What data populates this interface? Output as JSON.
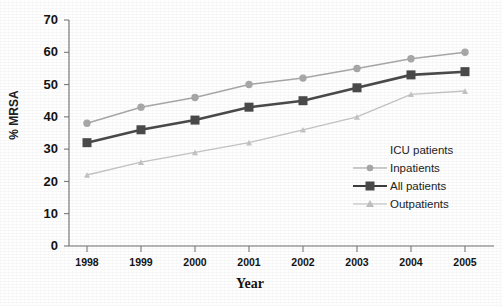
{
  "chart_data": {
    "type": "line",
    "title": "",
    "xlabel": "Year",
    "ylabel": "% MRSA",
    "categories": [
      "1998",
      "1999",
      "2000",
      "2001",
      "2002",
      "2003",
      "2004",
      "2005"
    ],
    "xlim": [
      1998,
      2005
    ],
    "ylim": [
      0,
      70
    ],
    "yticks": [
      "70",
      "60",
      "50",
      "40",
      "30",
      "20",
      "10",
      "0"
    ],
    "ytick_values": [
      70,
      60,
      50,
      40,
      30,
      20,
      10,
      0
    ],
    "grid": false,
    "legend_position": "inside-lower-right",
    "legend_title": "ICU patients",
    "series": [
      {
        "name": "ICU patients",
        "marker": "circle",
        "color": "#a8a8a8",
        "values": [
          38,
          43,
          46,
          50,
          52,
          55,
          58,
          60
        ]
      },
      {
        "name": "Inpatients",
        "marker": "circle",
        "color": "#a8a8a8",
        "values": [
          38,
          43,
          46,
          50,
          52,
          55,
          58,
          60
        ]
      },
      {
        "name": "All patients",
        "marker": "square",
        "color": "#4a4a4a",
        "values": [
          32,
          36,
          39,
          43,
          45,
          49,
          53,
          54
        ]
      },
      {
        "name": "Outpatients",
        "marker": "triangle",
        "color": "#c4c4c4",
        "values": [
          22,
          26,
          29,
          32,
          36,
          40,
          47,
          48
        ]
      }
    ]
  },
  "legend": {
    "rows": [
      {
        "label": "ICU patients",
        "marker": "none"
      },
      {
        "label": "Inpatients",
        "marker": "circle"
      },
      {
        "label": "All patients",
        "marker": "square"
      },
      {
        "label": "Outpatients",
        "marker": "triangle"
      }
    ]
  },
  "colors": {
    "inpatients": "#a8a8a8",
    "all_patients": "#4a4a4a",
    "outpatients": "#c4c4c4",
    "axis": "#6e6e6e",
    "text": "#141414"
  }
}
